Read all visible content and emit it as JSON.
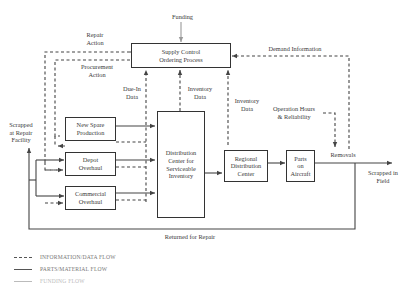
{
  "diagram": {
    "boxes": {
      "supply_control": "Supply Control\nOrdering Process",
      "new_spare": "New Spare\nProduction",
      "depot_overhaul": "Depot\nOverhaul",
      "commercial_overhaul": "Commercial\nOverhaul",
      "distribution_center": "Distribution\nCenter for\nServiceable\nInventory",
      "regional_distribution": "Regional\nDistribution\nCenter",
      "parts_on_aircraft": "Parts\non\nAircraft"
    },
    "labels": {
      "funding": "Funding",
      "repair_action": "Repair\nAction",
      "procurement_action": "Procurement\nAction",
      "due_in_data": "Due-In\nData",
      "inventory_data_1": "Inventory\nData",
      "inventory_data_2": "Inventory\nData",
      "demand_information": "Demand Information",
      "operation_hours": "Operation Hours\n& Reliability",
      "removals": "Removals",
      "scrapped_repair": "Scrapped\nat Repair\nFacility",
      "scrapped_field": "Scrapped in\nField",
      "returned_for_repair": "Returned for Repair"
    },
    "legend": [
      {
        "style": "dashed",
        "label": "INFORMATION/DATA FLOW",
        "color": "#555555"
      },
      {
        "style": "solid",
        "label": "PARTS/MATERIAL FLOW",
        "color": "#555555"
      },
      {
        "style": "solid-light",
        "label": "FUNDING FLOW",
        "color": "#bbbbbb"
      }
    ],
    "colors": {
      "line": "#444444",
      "funding": "#999999",
      "text": "#3a3a3a",
      "legend_text": "#777777"
    }
  }
}
